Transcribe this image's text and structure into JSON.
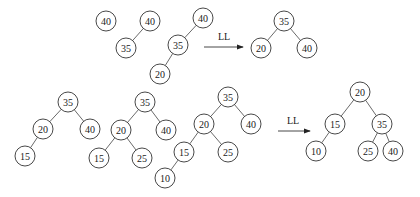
{
  "rows": [
    {
      "name": "top-row",
      "trees": [
        {
          "name": "tree-insert-40",
          "nodes": [
            {
              "id": "a",
              "value": "40"
            }
          ],
          "edges": []
        },
        {
          "name": "tree-insert-35",
          "nodes": [
            {
              "id": "a",
              "value": "40"
            },
            {
              "id": "b",
              "value": "35"
            }
          ],
          "edges": [
            [
              "a",
              "b"
            ]
          ]
        },
        {
          "name": "tree-insert-20-unbalanced",
          "nodes": [
            {
              "id": "a",
              "value": "40"
            },
            {
              "id": "b",
              "value": "35"
            },
            {
              "id": "c",
              "value": "20"
            }
          ],
          "edges": [
            [
              "a",
              "b"
            ],
            [
              "b",
              "c"
            ]
          ]
        },
        {
          "name": "tree-after-ll-rotation-1",
          "nodes": [
            {
              "id": "a",
              "value": "35"
            },
            {
              "id": "b",
              "value": "20"
            },
            {
              "id": "c",
              "value": "40"
            }
          ],
          "edges": [
            [
              "a",
              "b"
            ],
            [
              "a",
              "c"
            ]
          ]
        }
      ],
      "arrow": {
        "label": "LL"
      }
    },
    {
      "name": "bottom-row",
      "trees": [
        {
          "name": "tree-insert-15",
          "nodes": [
            {
              "id": "a",
              "value": "35"
            },
            {
              "id": "b",
              "value": "20"
            },
            {
              "id": "c",
              "value": "40"
            },
            {
              "id": "d",
              "value": "15"
            }
          ],
          "edges": [
            [
              "a",
              "b"
            ],
            [
              "a",
              "c"
            ],
            [
              "b",
              "d"
            ]
          ]
        },
        {
          "name": "tree-insert-25",
          "nodes": [
            {
              "id": "a",
              "value": "35"
            },
            {
              "id": "b",
              "value": "20"
            },
            {
              "id": "c",
              "value": "40"
            },
            {
              "id": "d",
              "value": "15"
            },
            {
              "id": "e",
              "value": "25"
            }
          ],
          "edges": [
            [
              "a",
              "b"
            ],
            [
              "a",
              "c"
            ],
            [
              "b",
              "d"
            ],
            [
              "b",
              "e"
            ]
          ]
        },
        {
          "name": "tree-insert-10-unbalanced",
          "nodes": [
            {
              "id": "a",
              "value": "35"
            },
            {
              "id": "b",
              "value": "20"
            },
            {
              "id": "c",
              "value": "40"
            },
            {
              "id": "d",
              "value": "15"
            },
            {
              "id": "e",
              "value": "25"
            },
            {
              "id": "f",
              "value": "10"
            }
          ],
          "edges": [
            [
              "a",
              "b"
            ],
            [
              "a",
              "c"
            ],
            [
              "b",
              "d"
            ],
            [
              "b",
              "e"
            ],
            [
              "d",
              "f"
            ]
          ]
        },
        {
          "name": "tree-after-ll-rotation-2",
          "nodes": [
            {
              "id": "a",
              "value": "20"
            },
            {
              "id": "b",
              "value": "15"
            },
            {
              "id": "c",
              "value": "35"
            },
            {
              "id": "d",
              "value": "10"
            },
            {
              "id": "e",
              "value": "25"
            },
            {
              "id": "f",
              "value": "40"
            }
          ],
          "edges": [
            [
              "a",
              "b"
            ],
            [
              "a",
              "c"
            ],
            [
              "b",
              "d"
            ],
            [
              "c",
              "e"
            ],
            [
              "c",
              "f"
            ]
          ]
        }
      ],
      "arrow": {
        "label": "LL"
      }
    }
  ]
}
